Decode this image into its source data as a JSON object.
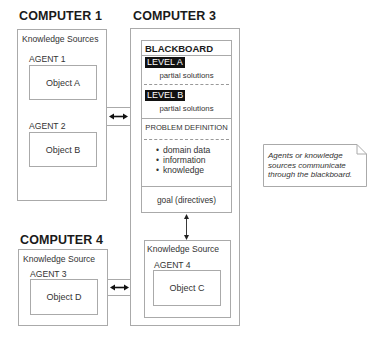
{
  "computer1": {
    "title": "COMPUTER 1",
    "section_label": "Knowledge Sources",
    "agents": [
      {
        "label": "AGENT 1",
        "object": "Object A"
      },
      {
        "label": "AGENT 2",
        "object": "Object B"
      }
    ]
  },
  "computer3": {
    "title": "COMPUTER 3",
    "blackboard": {
      "title": "BLACKBOARD",
      "levels": [
        {
          "label": "LEVEL A",
          "text": "partial solutions"
        },
        {
          "label": "LEVEL B",
          "text": "partial solutions"
        }
      ],
      "problem_definition": "PROBLEM DEFINITION",
      "bullets": [
        "domain data",
        "information",
        "knowledge"
      ],
      "goal": "goal (directives)"
    },
    "knowledge_source": {
      "label": "Knowledge Source",
      "agent": {
        "label": "AGENT 4",
        "object": "Object C"
      }
    }
  },
  "computer4": {
    "title": "COMPUTER 4",
    "section_label": "Knowledge Source",
    "agent": {
      "label": "AGENT 3",
      "object": "Object D"
    }
  },
  "note": {
    "text": "Agents or knowledge sources communicate through the blackboard."
  }
}
